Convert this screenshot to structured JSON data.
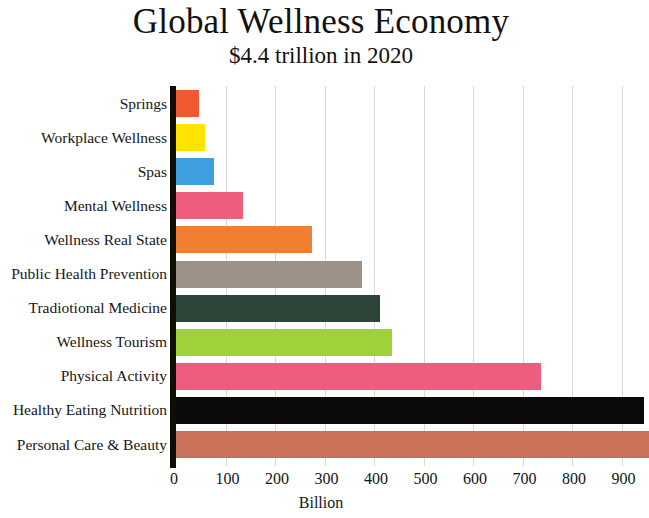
{
  "chart_data": {
    "type": "bar",
    "orientation": "horizontal",
    "title": "Global Wellness Economy",
    "subtitle": "$4.4 trillion in 2020",
    "xlabel": "Billion",
    "ylabel": "",
    "xlim": [
      0,
      1000
    ],
    "xticks": [
      0,
      100,
      200,
      300,
      400,
      500,
      600,
      700,
      800,
      900
    ],
    "grid": true,
    "legend": "none",
    "note": "Bottom two bars are clipped by the right edge of the image",
    "categories": [
      "Springs",
      "Workplace Wellness",
      "Spas",
      "Mental Wellness",
      "Wellness Real State",
      "Public Health Prevention",
      "Tradiotional Medicine",
      "Wellness Tourism",
      "Physical Activity",
      "Healthy Eating Nutrition",
      "Personal Care & Beauty"
    ],
    "values": [
      46,
      58,
      76,
      136,
      275,
      375,
      413,
      436,
      738,
      946,
      955
    ],
    "colors": [
      "#f05a33",
      "#ffe400",
      "#3fa0e0",
      "#ee5d7e",
      "#f07f32",
      "#9c9287",
      "#2d4438",
      "#9fd13a",
      "#ee5d7e",
      "#0b0a09",
      "#c97159"
    ]
  }
}
